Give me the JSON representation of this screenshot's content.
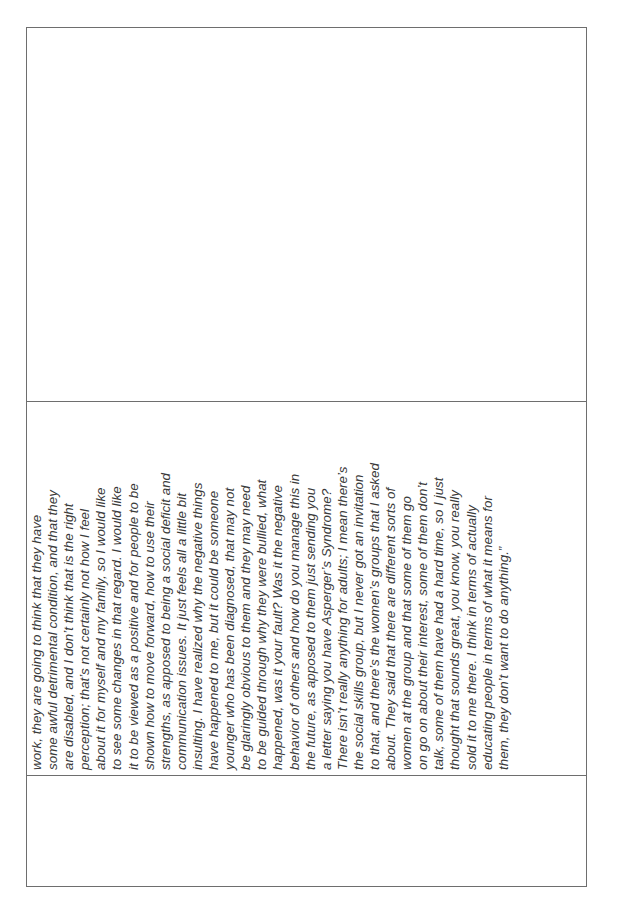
{
  "document": {
    "quote_lines": [
      "work, they are going to think that they have",
      "some awful detrimental condition, and that they",
      "are disabled, and I don’t think that is the right",
      "perception; that’s not certainly not how I feel",
      "about it for myself and my family, so I would like",
      "to see some changes in that regard. I would like",
      "it to be viewed as a positive and for people to be",
      "shown how to move forward, how to use their",
      "strengths, as apposed to being a social deficit and",
      "communication issues. It just feels all a little bit",
      "insulting. I have realized why the negative things",
      "have happened to me, but it could be someone",
      "younger who has been diagnosed, that may not",
      "be glaringly obvious to them and they may need",
      "to be guided through why they were bullied, what",
      "happened, was it your fault? Was it the negative",
      "behavior of others and how do you manage this in",
      "the future, as apposed to them just sending you",
      "a letter saying you have Asperger’s Syndrome?",
      "There isn’t really anything for adults; I mean there’s",
      "the social skills group, but I never got an invitation",
      "to that, and there’s the women’s groups that I asked",
      "about. They said that there are different sorts of",
      "women at the group and that some of them go",
      "on go on about their interest, some of them don’t",
      "talk, some of them have had a hard time, so I just",
      "thought that sounds great, you know, you really",
      "sold it to me there. I think in terms of actually",
      "educating people in terms of what it means for",
      "them, they don’t want to do anything.”"
    ]
  }
}
